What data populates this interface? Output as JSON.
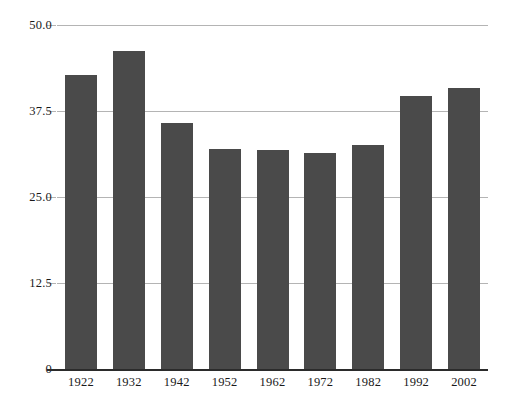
{
  "chart_data": {
    "type": "bar",
    "title": "",
    "subtitle": "",
    "xlabel": "",
    "ylabel": "",
    "categories": [
      "1922",
      "1932",
      "1942",
      "1952",
      "1962",
      "1972",
      "1982",
      "1992",
      "2002"
    ],
    "values": [
      42.7,
      46.2,
      35.7,
      32.0,
      31.8,
      31.4,
      32.6,
      39.7,
      40.8
    ],
    "ylim": [
      0,
      50
    ],
    "ytick_labels": [
      "50.0",
      "37.5",
      "25.0",
      "12.5",
      "0"
    ],
    "ytick_values": [
      50.0,
      37.5,
      25.0,
      12.5,
      0
    ],
    "grid": true,
    "legend": false,
    "legend_position": "none",
    "series": [
      {
        "name": "",
        "values": [
          42.7,
          46.2,
          35.7,
          32.0,
          31.8,
          31.4,
          32.6,
          39.7,
          40.8
        ]
      }
    ]
  },
  "style": {
    "bar_color": "#4a4a4a",
    "gridline_color": "#b4b4b4",
    "axis_color": "#2b2b2b",
    "text_color": "#1a1a1a",
    "background": "#ffffff"
  }
}
